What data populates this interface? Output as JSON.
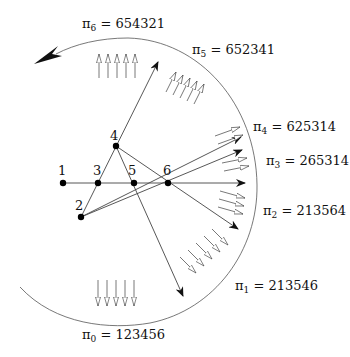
{
  "diagram": {
    "title": "",
    "points": [
      {
        "id": "1",
        "label": "1",
        "x": 63,
        "y": 183
      },
      {
        "id": "2",
        "label": "2",
        "x": 81,
        "y": 217
      },
      {
        "id": "3",
        "label": "3",
        "x": 98,
        "y": 183
      },
      {
        "id": "4",
        "label": "4",
        "x": 116,
        "y": 146
      },
      {
        "id": "5",
        "label": "5",
        "x": 134,
        "y": 183
      },
      {
        "id": "6",
        "label": "6",
        "x": 168,
        "y": 183
      }
    ],
    "permutations": [
      {
        "symbol": "π",
        "sub": "0",
        "eq": " = 123456",
        "x": 82,
        "y": 339
      },
      {
        "symbol": "π",
        "sub": "1",
        "eq": " = 213546",
        "x": 235,
        "y": 290
      },
      {
        "symbol": "π",
        "sub": "2",
        "eq": " = 213564",
        "x": 263,
        "y": 215
      },
      {
        "symbol": "π",
        "sub": "3",
        "eq": " = 265314",
        "x": 266,
        "y": 165
      },
      {
        "symbol": "π",
        "sub": "4",
        "eq": " = 625314",
        "x": 253,
        "y": 131
      },
      {
        "symbol": "π",
        "sub": "5",
        "eq": " = 652341",
        "x": 192,
        "y": 54
      },
      {
        "symbol": "π",
        "sub": "6",
        "eq": " = 654321",
        "x": 82,
        "y": 28
      }
    ],
    "rotation_arrow": "counter-clockwise"
  }
}
